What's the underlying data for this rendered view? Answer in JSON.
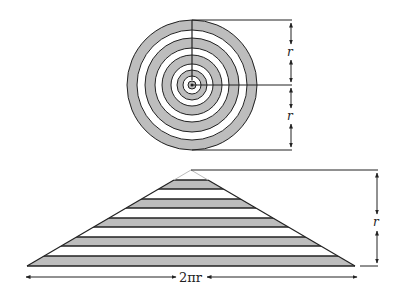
{
  "diagram": {
    "colors": {
      "ring_fill": "#bdbdbd",
      "stroke": "#222222",
      "background": "#ffffff"
    },
    "circle": {
      "center": [
        192,
        85
      ],
      "ring_count": 5,
      "labels": {
        "upper_radius": "r",
        "lower_radius": "r"
      }
    },
    "triangle": {
      "apex": [
        191,
        170
      ],
      "base_left": [
        27,
        266
      ],
      "base_right": [
        355,
        266
      ],
      "stripe_count": 5,
      "labels": {
        "height": "r",
        "base": "2πr"
      }
    }
  }
}
